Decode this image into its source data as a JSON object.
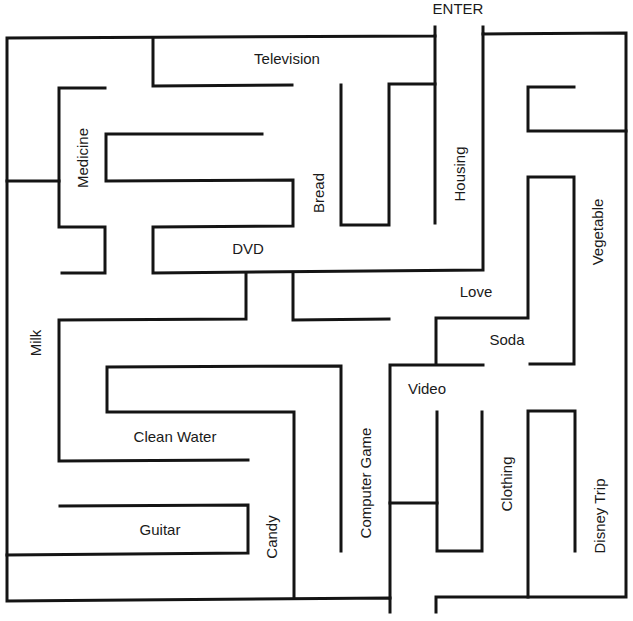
{
  "diagram": {
    "type": "maze",
    "entrance_label": "ENTER",
    "stroke_color": "#141414",
    "background_color": "#ffffff",
    "labels": [
      {
        "id": "television",
        "text": "Television",
        "orientation": "horizontal"
      },
      {
        "id": "medicine",
        "text": "Medicine",
        "orientation": "vertical"
      },
      {
        "id": "bread",
        "text": "Bread",
        "orientation": "vertical"
      },
      {
        "id": "housing",
        "text": "Housing",
        "orientation": "vertical"
      },
      {
        "id": "vegetable",
        "text": "Vegetable",
        "orientation": "vertical"
      },
      {
        "id": "dvd",
        "text": "DVD",
        "orientation": "horizontal"
      },
      {
        "id": "love",
        "text": "Love",
        "orientation": "horizontal"
      },
      {
        "id": "milk",
        "text": "Milk",
        "orientation": "vertical"
      },
      {
        "id": "soda",
        "text": "Soda",
        "orientation": "horizontal"
      },
      {
        "id": "video",
        "text": "Video",
        "orientation": "horizontal"
      },
      {
        "id": "clean-water",
        "text": "Clean Water",
        "orientation": "horizontal"
      },
      {
        "id": "computer-game",
        "text": "Computer Game",
        "orientation": "vertical"
      },
      {
        "id": "clothing",
        "text": "Clothing",
        "orientation": "vertical"
      },
      {
        "id": "guitar",
        "text": "Guitar",
        "orientation": "horizontal"
      },
      {
        "id": "candy",
        "text": "Candy",
        "orientation": "vertical"
      },
      {
        "id": "disney-trip",
        "text": "Disney Trip",
        "orientation": "vertical"
      }
    ]
  }
}
